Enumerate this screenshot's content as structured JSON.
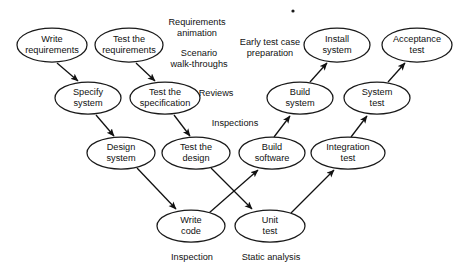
{
  "diagram": {
    "background_color": "#ffffff",
    "stroke_color": "#111111",
    "nodes": [
      {
        "id": "write-requirements",
        "lines": [
          "Write",
          "requirements"
        ],
        "cx": 52,
        "cy": 45,
        "rx": 35,
        "ry": 17
      },
      {
        "id": "test-the-requirements",
        "lines": [
          "Test the",
          "requirements"
        ],
        "cx": 129,
        "cy": 45,
        "rx": 34,
        "ry": 17
      },
      {
        "id": "install-system",
        "lines": [
          "Install",
          "system"
        ],
        "cx": 337,
        "cy": 45,
        "rx": 33,
        "ry": 17
      },
      {
        "id": "acceptance-test",
        "lines": [
          "Acceptance",
          "test"
        ],
        "cx": 417,
        "cy": 45,
        "rx": 35,
        "ry": 17
      },
      {
        "id": "specify-system",
        "lines": [
          "Specify",
          "system"
        ],
        "cx": 88,
        "cy": 98,
        "rx": 33,
        "ry": 16
      },
      {
        "id": "test-the-specification",
        "lines": [
          "Test the",
          "specification"
        ],
        "cx": 165,
        "cy": 98,
        "rx": 35,
        "ry": 16
      },
      {
        "id": "build-system",
        "lines": [
          "Build",
          "system"
        ],
        "cx": 300,
        "cy": 98,
        "rx": 33,
        "ry": 16
      },
      {
        "id": "system-test",
        "lines": [
          "System",
          "test"
        ],
        "cx": 377,
        "cy": 98,
        "rx": 33,
        "ry": 16
      },
      {
        "id": "design-system",
        "lines": [
          "Design",
          "system"
        ],
        "cx": 121,
        "cy": 153,
        "rx": 34,
        "ry": 16
      },
      {
        "id": "test-the-design",
        "lines": [
          "Test the",
          "design"
        ],
        "cx": 196,
        "cy": 153,
        "rx": 34,
        "ry": 16
      },
      {
        "id": "build-software",
        "lines": [
          "Build",
          "software"
        ],
        "cx": 272,
        "cy": 153,
        "rx": 33,
        "ry": 16
      },
      {
        "id": "integration-test",
        "lines": [
          "Integration",
          "test"
        ],
        "cx": 348,
        "cy": 153,
        "rx": 37,
        "ry": 16
      },
      {
        "id": "write-code",
        "lines": [
          "Write",
          "code"
        ],
        "cx": 191,
        "cy": 226,
        "rx": 34,
        "ry": 16
      },
      {
        "id": "unit-test",
        "lines": [
          "Unit",
          "test"
        ],
        "cx": 270,
        "cy": 226,
        "rx": 35,
        "ry": 16
      }
    ],
    "edges": [
      {
        "id": "write-requirements-to-specify-system",
        "from": "write-requirements",
        "to": "specify-system",
        "x1": 57,
        "y1": 63,
        "x2": 78,
        "y2": 81
      },
      {
        "id": "test-requirements-to-test-specification",
        "from": "test-the-requirements",
        "to": "test-the-specification",
        "x1": 136,
        "y1": 63,
        "x2": 155,
        "y2": 81
      },
      {
        "id": "specify-system-to-design-system",
        "from": "specify-system",
        "to": "design-system",
        "x1": 96,
        "y1": 115,
        "x2": 114,
        "y2": 136
      },
      {
        "id": "test-specification-to-test-design",
        "from": "test-the-specification",
        "to": "test-the-design",
        "x1": 174,
        "y1": 115,
        "x2": 190,
        "y2": 136
      },
      {
        "id": "design-system-to-write-code",
        "from": "design-system",
        "to": "write-code",
        "x1": 137,
        "y1": 168,
        "x2": 176,
        "y2": 209
      },
      {
        "id": "test-design-to-unit-test",
        "from": "test-the-design",
        "to": "unit-test",
        "x1": 211,
        "y1": 168,
        "x2": 252,
        "y2": 209
      },
      {
        "id": "write-code-to-build-software",
        "from": "write-code",
        "to": "build-software",
        "x1": 209,
        "y1": 213,
        "x2": 258,
        "y2": 170
      },
      {
        "id": "unit-test-to-integration-test",
        "from": "unit-test",
        "to": "integration-test",
        "x1": 291,
        "y1": 213,
        "x2": 334,
        "y2": 170
      },
      {
        "id": "build-software-to-build-system",
        "from": "build-software",
        "to": "build-system",
        "x1": 274,
        "y1": 137,
        "x2": 290,
        "y2": 116
      },
      {
        "id": "integration-test-to-system-test",
        "from": "integration-test",
        "to": "system-test",
        "x1": 351,
        "y1": 137,
        "x2": 367,
        "y2": 116
      },
      {
        "id": "build-system-to-install-system",
        "from": "build-system",
        "to": "install-system",
        "x1": 310,
        "y1": 82,
        "x2": 327,
        "y2": 63
      },
      {
        "id": "system-test-to-acceptance-test",
        "from": "system-test",
        "to": "acceptance-test",
        "x1": 388,
        "y1": 82,
        "x2": 405,
        "y2": 63
      }
    ],
    "annotations": [
      {
        "id": "requirements-animation",
        "lines": [
          "Requirements",
          "animation"
        ],
        "x": 197,
        "y": 28
      },
      {
        "id": "scenario-walk-throughs",
        "lines": [
          "Scenario",
          "walk-throughs"
        ],
        "x": 199,
        "y": 59
      },
      {
        "id": "early-test-case-preparation",
        "lines": [
          "Early test case",
          "preparation"
        ],
        "x": 270,
        "y": 48
      },
      {
        "id": "reviews",
        "lines": [
          "Reviews"
        ],
        "x": 216,
        "y": 94
      },
      {
        "id": "inspections",
        "lines": [
          "Inspections"
        ],
        "x": 235,
        "y": 124
      },
      {
        "id": "inspection",
        "lines": [
          "Inspection"
        ],
        "x": 192,
        "y": 258
      },
      {
        "id": "static-analysis",
        "lines": [
          "Static analysis"
        ],
        "x": 271,
        "y": 258
      }
    ],
    "specks": [
      {
        "id": "scan-speck",
        "cx": 293,
        "cy": 11,
        "r": 1.6
      }
    ]
  }
}
